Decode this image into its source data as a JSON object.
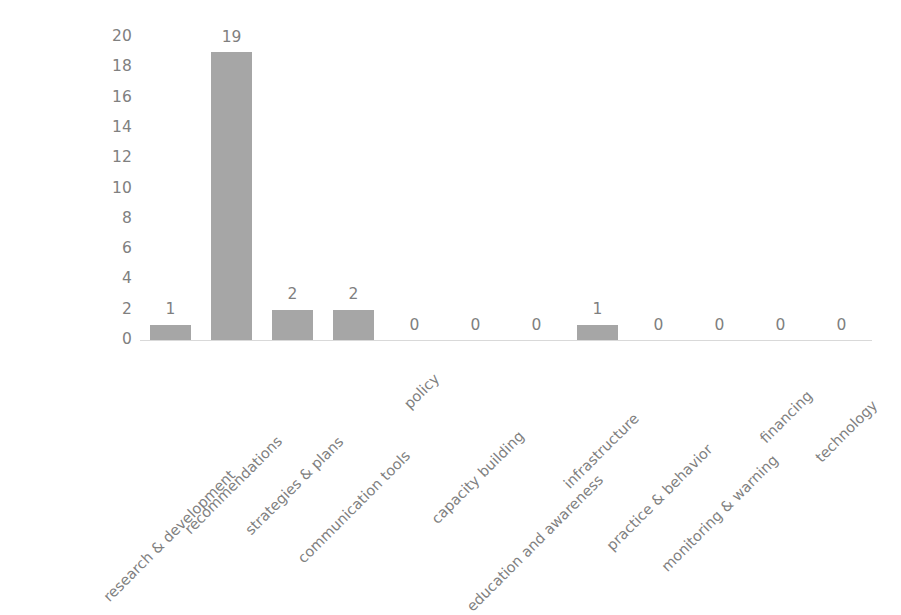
{
  "chart_data": {
    "type": "bar",
    "title": "",
    "subtitle": "",
    "xlabel": "",
    "ylabel": "",
    "ylim": [
      0,
      20
    ],
    "ytick_step": 2,
    "yticks": [
      "20",
      "18",
      "16",
      "14",
      "12",
      "10",
      "8",
      "6",
      "4",
      "2",
      "0"
    ],
    "grid": false,
    "legend": "none",
    "label_rotation": -45,
    "categories": [
      "research & development",
      "recommendations",
      "strategies & plans",
      "communication tools",
      "policy",
      "capacity building",
      "education and awareness",
      "infrastructure",
      "practice & behavior",
      "monitoring & warning",
      "financing",
      "technology"
    ],
    "values": [
      1,
      19,
      2,
      2,
      0,
      0,
      0,
      1,
      0,
      0,
      0,
      0
    ],
    "value_labels": [
      "1",
      "19",
      "2",
      "2",
      "0",
      "0",
      "0",
      "1",
      "0",
      "0",
      "0",
      "0"
    ],
    "colors": {
      "bar": "#a6a6a6",
      "text": "#808080",
      "value_label": "#7f7f7f",
      "axis_line": "#d9d9d9",
      "background": "#ffffff"
    }
  }
}
